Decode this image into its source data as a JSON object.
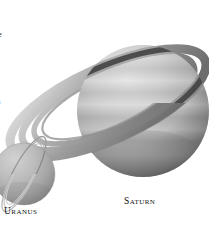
{
  "figure": {
    "kind": "astronomy-illustration",
    "background_color": "#ffffff",
    "palette": {
      "planet_light": "#d8d8d8",
      "planet_mid": "#b0b0b0",
      "planet_dark": "#8a8a8a",
      "planet_shadow": "#6a6a6a",
      "ring_light": "#cfcfcf",
      "ring_mid": "#a6a6a6",
      "ring_dark": "#7c7c7c",
      "ring_shadow_on_planet": "#3c3c3c",
      "caption_color": "#111111",
      "text_color": "#1b1b1b"
    }
  },
  "planets": [
    {
      "name": "saturn",
      "caption": "Saturn",
      "position": "upper-right",
      "relative_size": "large",
      "has_rings": true,
      "ring_count": 4,
      "ring_tilt_description": "wide open ellipse tilted about 25 degrees",
      "band_count": 7
    },
    {
      "name": "uranus",
      "caption": "Uranus",
      "position": "lower-left",
      "relative_size": "small",
      "has_rings": true,
      "ring_count": 3,
      "ring_tilt_description": "narrow rings tilted steeply near vertical",
      "band_count": 0
    }
  ],
  "captions": {
    "saturn_label": "Saturn",
    "uranus_label": "Uranus"
  },
  "bleed_text": {
    "line_1": "e",
    "line_2": "s,",
    "line_3": "e us",
    "line_4": "s."
  }
}
